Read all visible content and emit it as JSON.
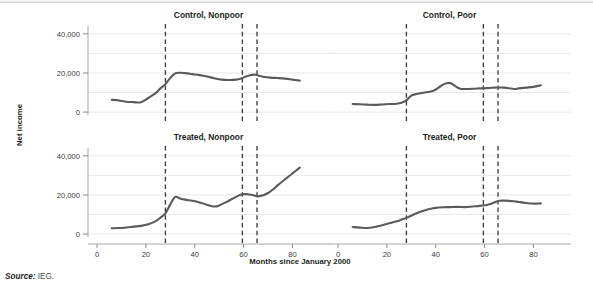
{
  "figure": {
    "source_label": "Source:",
    "source_value": "IEG.",
    "y_axis_title": "Net income",
    "x_axis_title": "Months since January 2000"
  },
  "chart_data": {
    "type": "line",
    "title": "",
    "xlabel": "Months since January 2000",
    "ylabel": "Net income",
    "xlim": [
      0,
      88
    ],
    "ylim": [
      -2000,
      44000
    ],
    "xticks": [
      0,
      20,
      40,
      60,
      80
    ],
    "xtick_labels": [
      "0",
      "20",
      "40",
      "60",
      "80"
    ],
    "yticks": [
      0,
      20000,
      40000
    ],
    "ytick_labels": [
      "0",
      "20,000",
      "40,000"
    ],
    "grid": true,
    "legend": "none",
    "annotations": {
      "vertical_reference_lines_months": [
        28,
        59.5,
        65.5
      ],
      "line_style": "dashed"
    },
    "panels": [
      {
        "title": "Control, Nonpoor",
        "row": 0,
        "col": 0,
        "series": [
          {
            "name": "Control, Nonpoor",
            "x": [
              6,
              9,
              12,
              15,
              18,
              21,
              24,
              26,
              28,
              30,
              32,
              34,
              36,
              39,
              42,
              45,
              48,
              51,
              54,
              57,
              59,
              61,
              63,
              65,
              66,
              68,
              71,
              74,
              77,
              80,
              83
            ],
            "y": [
              6300,
              5900,
              5300,
              5100,
              5000,
              7200,
              9700,
              12200,
              14300,
              17500,
              19800,
              20100,
              19900,
              19400,
              18900,
              18200,
              17300,
              16600,
              16400,
              16600,
              17200,
              18200,
              19000,
              19100,
              18700,
              18100,
              17600,
              17400,
              17100,
              16600,
              16100
            ]
          }
        ]
      },
      {
        "title": "Control, Poor",
        "row": 0,
        "col": 1,
        "series": [
          {
            "name": "Control, Poor",
            "x": [
              6,
              9,
              12,
              15,
              18,
              21,
              24,
              26,
              28,
              30,
              32,
              34,
              36,
              39,
              42,
              44,
              46,
              48,
              50,
              52,
              55,
              58,
              60,
              62,
              64,
              66,
              68,
              70,
              72,
              74,
              77,
              80,
              83
            ],
            "y": [
              4100,
              4000,
              3800,
              3700,
              3900,
              4100,
              4300,
              4800,
              6000,
              8400,
              9200,
              9700,
              10100,
              10900,
              13200,
              14600,
              14800,
              13300,
              11900,
              11800,
              11900,
              12100,
              12200,
              12300,
              12500,
              12600,
              12500,
              12200,
              11800,
              12100,
              12500,
              12900,
              13700
            ]
          }
        ]
      },
      {
        "title": "Treated, Nonpoor",
        "row": 1,
        "col": 0,
        "series": [
          {
            "name": "Treated, Nonpoor",
            "x": [
              6,
              9,
              12,
              15,
              18,
              21,
              24,
              26,
              28,
              30,
              32,
              34,
              36,
              39,
              42,
              45,
              48,
              50,
              53,
              56,
              59,
              61,
              63,
              65,
              66,
              68,
              70,
              72,
              74,
              77,
              80,
              83
            ],
            "y": [
              3000,
              3100,
              3400,
              3800,
              4200,
              5000,
              6600,
              8400,
              10600,
              15200,
              19000,
              18200,
              17600,
              17000,
              16200,
              15000,
              14100,
              14600,
              16400,
              18400,
              20200,
              20400,
              20100,
              19500,
              19300,
              19800,
              21000,
              22800,
              25000,
              28000,
              31000,
              34000
            ]
          }
        ]
      },
      {
        "title": "Treated, Poor",
        "row": 1,
        "col": 1,
        "series": [
          {
            "name": "Treated, Poor",
            "x": [
              6,
              9,
              12,
              15,
              18,
              21,
              24,
              26,
              28,
              31,
              34,
              37,
              40,
              43,
              46,
              49,
              52,
              55,
              58,
              60,
              62,
              64,
              66,
              68,
              70,
              72,
              74,
              77,
              80,
              83
            ],
            "y": [
              3600,
              3300,
              3100,
              3600,
              4500,
              5500,
              6500,
              7400,
              8300,
              10000,
              11500,
              12700,
              13400,
              13700,
              13800,
              13900,
              13800,
              14100,
              14400,
              14700,
              15200,
              16200,
              17000,
              17100,
              17000,
              16800,
              16400,
              15900,
              15600,
              15700
            ]
          }
        ]
      }
    ]
  }
}
